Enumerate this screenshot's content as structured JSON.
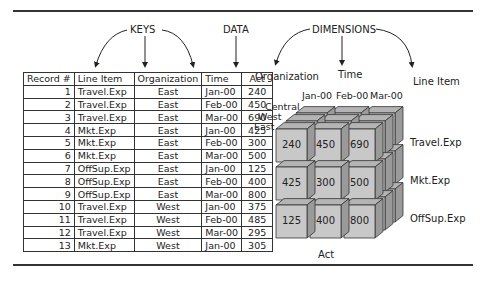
{
  "labels": {
    "keys": "KEYS",
    "data": "DATA",
    "dimensions": "DIMENSIONS",
    "dim_organization": "Organization",
    "dim_time": "Time",
    "dim_line_item": "Line Item",
    "cube_measure": "Act"
  },
  "table": {
    "headers": [
      "Record #",
      "Line Item",
      "Organization",
      "Time",
      "Act"
    ],
    "rows": [
      [
        "1",
        "Travel.Exp",
        "East",
        "Jan-00",
        "240"
      ],
      [
        "2",
        "Travel.Exp",
        "East",
        "Feb-00",
        "450"
      ],
      [
        "3",
        "Travel.Exp",
        "East",
        "Mar-00",
        "690"
      ],
      [
        "4",
        "Mkt.Exp",
        "East",
        "Jan-00",
        "425"
      ],
      [
        "5",
        "Mkt.Exp",
        "East",
        "Feb-00",
        "300"
      ],
      [
        "6",
        "Mkt.Exp",
        "East",
        "Mar-00",
        "500"
      ],
      [
        "7",
        "OffSup.Exp",
        "East",
        "Jan-00",
        "125"
      ],
      [
        "8",
        "OffSup.Exp",
        "East",
        "Feb-00",
        "400"
      ],
      [
        "9",
        "OffSup.Exp",
        "East",
        "Mar-00",
        "800"
      ],
      [
        "10",
        "Travel.Exp",
        "West",
        "Jan-00",
        "375"
      ],
      [
        "11",
        "Travel.Exp",
        "West",
        "Feb-00",
        "485"
      ],
      [
        "12",
        "Travel.Exp",
        "West",
        "Mar-00",
        "295"
      ],
      [
        "13",
        "Mkt.Exp",
        "West",
        "Jan-00",
        "305"
      ]
    ]
  },
  "cube": {
    "time_labels": [
      "Jan-00",
      "Feb-00",
      "Mar-00"
    ],
    "org_labels": [
      "Central",
      "West",
      "East"
    ],
    "line_item_labels": [
      "Travel.Exp",
      "Mkt.Exp",
      "OffSup.Exp"
    ],
    "front_values": [
      [
        "240",
        "450",
        "690"
      ],
      [
        "425",
        "300",
        "500"
      ],
      [
        "125",
        "400",
        "800"
      ]
    ],
    "face_color": "#c8c8c8",
    "top_color": "#b4b4b4",
    "side_color": "#9a9a9a"
  }
}
